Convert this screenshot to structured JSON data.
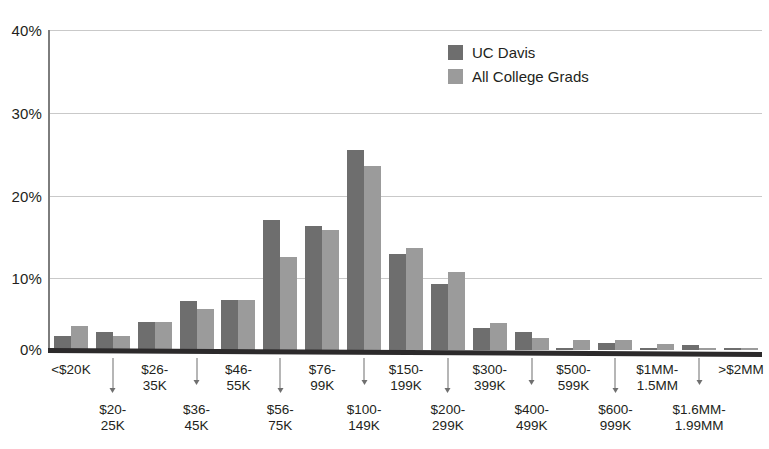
{
  "chart_data": {
    "type": "bar",
    "title": "",
    "subtitle": "",
    "xlabel": "",
    "ylabel": "",
    "ylim": [
      0,
      40
    ],
    "y_ticks": [
      0,
      10,
      20,
      30,
      40
    ],
    "y_tick_labels": [
      "0%",
      "10%",
      "20%",
      "30%",
      "40%"
    ],
    "grid": true,
    "legend_position": "top-center-right",
    "value_unit": "percent",
    "categories": [
      "<$20K",
      "$20-\n25K",
      "$26-\n35K",
      "$36-\n45K",
      "$46-\n55K",
      "$56-\n75K",
      "$76-\n99K",
      "$100-\n149K",
      "$150-\n199K",
      "$200-\n299K",
      "$300-\n399K",
      "$400-\n499K",
      "$500-\n599K",
      "$600-\n999K",
      "$1MM-\n1.5MM",
      "$1.6MM-\n1.99MM",
      ">$2MM"
    ],
    "series": [
      {
        "name": "UC Davis",
        "color": "#6e6e6e",
        "values": [
          1.8,
          2.3,
          3.5,
          6.1,
          6.2,
          16.3,
          15.5,
          25.0,
          12.0,
          8.2,
          2.8,
          2.3,
          0.2,
          0.9,
          0.2,
          0.6,
          0.2
        ]
      },
      {
        "name": "All College Grads",
        "color": "#9b9b9b",
        "values": [
          3.0,
          1.8,
          3.5,
          5.1,
          6.2,
          11.6,
          15.0,
          23.0,
          12.7,
          9.7,
          3.4,
          1.5,
          1.3,
          1.2,
          0.8,
          0.3,
          0.2
        ]
      }
    ]
  },
  "legend": {
    "items": [
      {
        "label": "UC Davis",
        "color": "#6e6e6e"
      },
      {
        "label": "All College Grads",
        "color": "#9b9b9b"
      }
    ]
  },
  "axis": {
    "y_tick_labels": [
      "40%",
      "30%",
      "20%",
      "10%",
      "0%"
    ]
  }
}
